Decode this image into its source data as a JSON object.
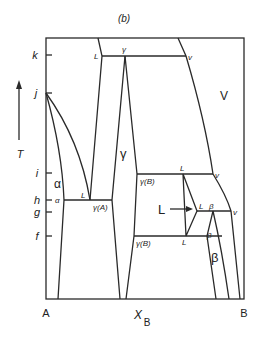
{
  "figure": {
    "panel_label": "(b)",
    "axis_x_label": "X",
    "axis_x_subscript": "B",
    "axis_y_label": "T",
    "left_end": "A",
    "right_end": "B"
  },
  "temperature_ticks": [
    {
      "label": "k",
      "y": 55
    },
    {
      "label": "j",
      "y": 93
    },
    {
      "label": "i",
      "y": 173
    },
    {
      "label": "h",
      "y": 200
    },
    {
      "label": "g",
      "y": 212
    },
    {
      "label": "f",
      "y": 236
    }
  ],
  "phase_regions": {
    "alpha": "α",
    "gamma": "γ",
    "vapor": "V",
    "liquid": "L",
    "beta": "β"
  },
  "point_labels": {
    "k_L": "L",
    "k_gamma": "γ",
    "k_v": "v",
    "h_alpha": "α",
    "h_L": "L",
    "h_gammaA": "γ(A)",
    "i_L": "L",
    "i_gammaB": "γ(B)",
    "i_v": "v",
    "g_L": "L",
    "g_beta": "β",
    "g_v": "v",
    "f_gammaB": "γ(B)",
    "f_L": "L",
    "f_beta": "β"
  },
  "colors": {
    "line": "#2a2a2a",
    "text": "#222222",
    "background": "#ffffff"
  }
}
